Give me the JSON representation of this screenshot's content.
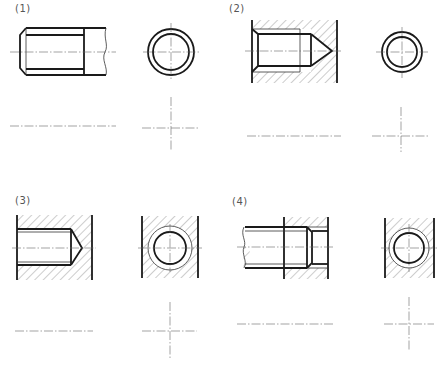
{
  "panels": [
    {
      "id": 1,
      "label": "(1)",
      "label_pos": [
        15,
        3
      ]
    },
    {
      "id": 2,
      "label": "(2)",
      "label_pos": [
        229,
        3
      ]
    },
    {
      "id": 3,
      "label": "(3)",
      "label_pos": [
        15,
        195
      ]
    },
    {
      "id": 4,
      "label": "(4)",
      "label_pos": [
        232,
        196
      ]
    }
  ],
  "colors": {
    "line": "#1a1a1a",
    "thin_line": "#333333",
    "center_line": "#666666",
    "hatch": "#555555",
    "background": "#ffffff"
  },
  "views": {
    "p1_front": "external thread (bolt) side view",
    "p1_end": "external thread end view",
    "p2_front": "internal threaded blind hole section",
    "p2_end": "internal thread end view",
    "p3_front": "threaded blind hole section (exercise)",
    "p3_end": "threaded hole end view (exercise)",
    "p4_front": "threaded connection section (exercise)",
    "p4_end": "threaded connection end view (exercise)"
  },
  "answer_blanks": [
    {
      "panel": 1,
      "horizontal": {
        "x1": 10,
        "x2": 116,
        "y": 126
      },
      "cross": {
        "cx": 171,
        "cy": 128,
        "x1": 142,
        "x2": 200,
        "y1": 97,
        "y2": 150
      }
    },
    {
      "panel": 2,
      "horizontal": {
        "x1": 247,
        "x2": 341,
        "y": 136
      },
      "cross": {
        "cx": 401,
        "cy": 136,
        "x1": 372,
        "x2": 428,
        "y1": 107,
        "y2": 152
      }
    },
    {
      "panel": 3,
      "horizontal": {
        "x1": 15,
        "x2": 93,
        "y": 331
      },
      "cross": {
        "cx": 170,
        "cy": 331,
        "x1": 142,
        "x2": 197,
        "y1": 302,
        "y2": 360
      }
    },
    {
      "panel": 4,
      "horizontal": {
        "x1": 237,
        "x2": 334,
        "y": 324
      },
      "cross": {
        "cx": 409,
        "cy": 324,
        "x1": 384,
        "x2": 434,
        "y1": 297,
        "y2": 351
      }
    }
  ]
}
